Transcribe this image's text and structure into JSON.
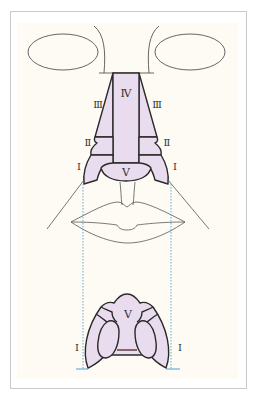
{
  "figure": {
    "colors": {
      "background": "#fdfbf4",
      "subunit_fill": "#eadcef",
      "outline": "#2a2a2a",
      "face_line": "#555555",
      "guide_line": "#4aa3d8"
    },
    "frontal_view": {
      "labels": {
        "dorsum": "Ⅳ",
        "sidewall_left": "Ⅲ",
        "sidewall_right": "Ⅲ",
        "soft_triangle_left": "Ⅱ",
        "soft_triangle_right": "Ⅱ",
        "ala_left": "Ⅰ",
        "ala_right": "Ⅰ",
        "tip": "Ⅴ"
      }
    },
    "basal_view": {
      "labels": {
        "tip": "Ⅴ",
        "ala_left": "Ⅰ",
        "ala_right": "Ⅰ"
      }
    }
  }
}
